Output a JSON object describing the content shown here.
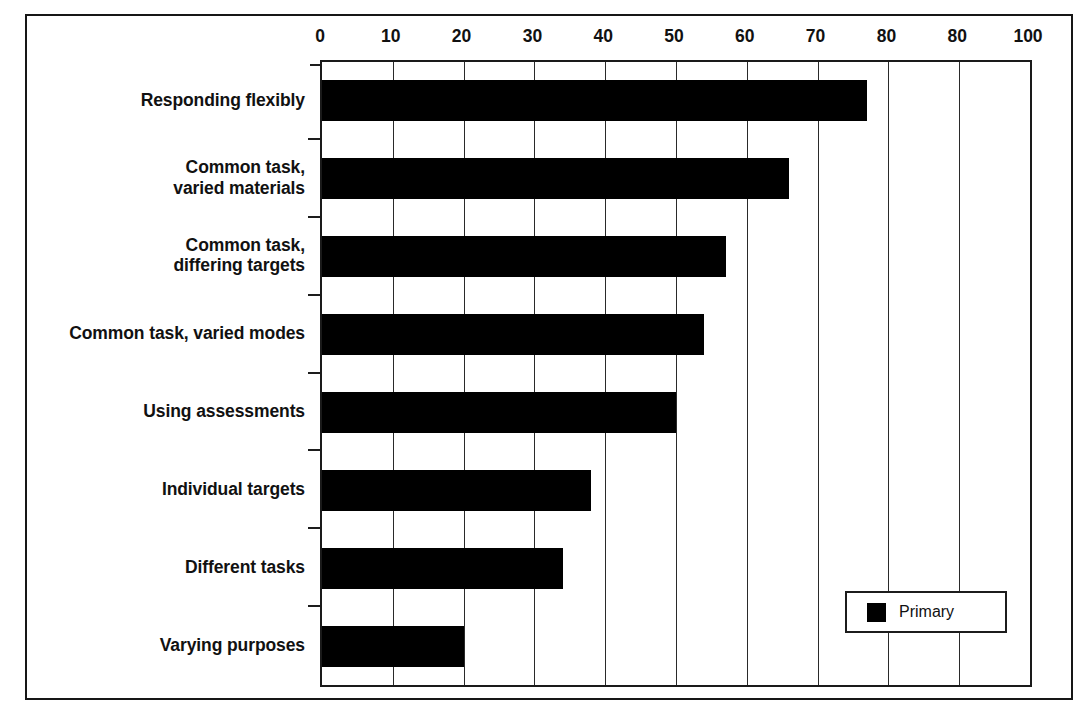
{
  "chart_data": {
    "type": "bar",
    "orientation": "horizontal",
    "title": "",
    "xlabel": "",
    "ylabel": "",
    "xlim": [
      0,
      100
    ],
    "ylim": null,
    "grid": true,
    "grid_axis": "x",
    "legend_position": "bottom-right",
    "bar_color": "#000000",
    "categories": [
      "Responding flexibly",
      "Common task, varied materials",
      "Common task, differing targets",
      "Common task, varied modes",
      "Using assessments",
      "Individual targets",
      "Different tasks",
      "Varying purposes"
    ],
    "series": [
      {
        "name": "Primary",
        "color": "#000000",
        "values": [
          77,
          66,
          57,
          54,
          50,
          38,
          34,
          20
        ]
      }
    ],
    "xticks": [
      0,
      10,
      20,
      30,
      40,
      50,
      60,
      70,
      80,
      90,
      100
    ],
    "xtick_labels": [
      "0",
      "10",
      "20",
      "30",
      "40",
      "50",
      "60",
      "70",
      "80",
      "80",
      "100"
    ]
  },
  "categories_wrapped": [
    [
      "Responding flexibly"
    ],
    [
      "Common task,",
      "varied materials"
    ],
    [
      "Common task,",
      "differing targets"
    ],
    [
      "Common task, varied modes"
    ],
    [
      "Using assessments"
    ],
    [
      "Individual targets"
    ],
    [
      "Different tasks"
    ],
    [
      "Varying purposes"
    ]
  ],
  "legend": {
    "entries": [
      {
        "label": "Primary",
        "color": "#000000"
      }
    ]
  }
}
